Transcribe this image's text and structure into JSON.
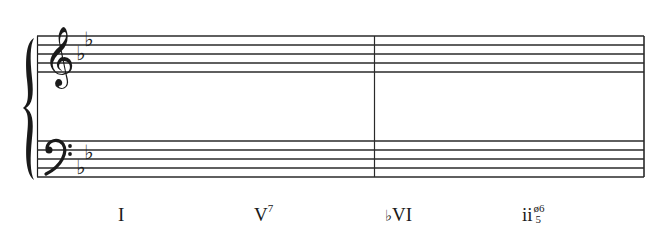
{
  "score": {
    "key_signature": "B-flat major (2 flats)",
    "staves": [
      {
        "name": "treble",
        "clef": "treble-clef",
        "line_y": [
          36,
          45,
          54,
          63,
          72
        ]
      },
      {
        "name": "bass",
        "clef": "bass-clef",
        "line_y": [
          141,
          150,
          159,
          168,
          177
        ]
      }
    ],
    "measures": 2,
    "colors": {
      "ink": "#1a1a1a",
      "background": "#ffffff"
    }
  },
  "analysis": {
    "chords": [
      {
        "label": "I",
        "flat": "",
        "superscript": "",
        "figure_top": "",
        "figure_bottom": ""
      },
      {
        "label": "V",
        "flat": "",
        "superscript": "7",
        "figure_top": "",
        "figure_bottom": ""
      },
      {
        "label": "VI",
        "flat": "♭",
        "superscript": "",
        "figure_top": "",
        "figure_bottom": ""
      },
      {
        "label": "ii",
        "flat": "",
        "superscript": "",
        "figure_top": "ø6",
        "figure_bottom": "5"
      }
    ]
  }
}
